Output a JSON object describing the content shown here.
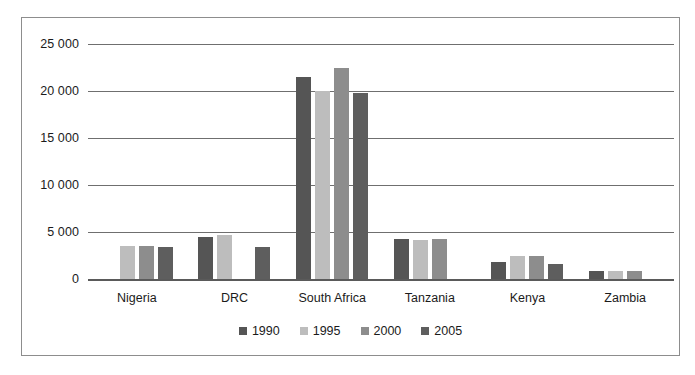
{
  "chart_data": {
    "type": "bar",
    "title": "",
    "subtitle": "",
    "xlabel": "",
    "ylabel": "",
    "categories": [
      "Nigeria",
      "DRC",
      "South Africa",
      "Tanzania",
      "Kenya",
      "Zambia"
    ],
    "series": [
      {
        "name": "1990",
        "color": "#555555",
        "values": [
          null,
          4500,
          21500,
          4250,
          1800,
          850
        ]
      },
      {
        "name": "1995",
        "color": "#bdbdbd",
        "values": [
          3500,
          4650,
          20050,
          4200,
          2400,
          900
        ]
      },
      {
        "name": "2000",
        "color": "#8d8d8d",
        "values": [
          3500,
          null,
          22450,
          4300,
          2400,
          880
        ]
      },
      {
        "name": "2005",
        "color": "#5e5e5e",
        "values": [
          3450,
          3450,
          19800,
          null,
          1600,
          null
        ]
      }
    ],
    "ylim": [
      0,
      25000
    ],
    "yticks": [
      0,
      5000,
      10000,
      15000,
      20000,
      25000
    ],
    "ytick_labels": [
      "0",
      "5 000",
      "10 000",
      "15 000",
      "20 000",
      "25 000"
    ],
    "grid": true,
    "legend_position": "bottom",
    "legend": [
      "1990",
      "1995",
      "2000",
      "2005"
    ],
    "frame": true,
    "frame_color": "#8d8d8d",
    "gridline_color": "#6f6f6f",
    "text_color": "#1b1b1b"
  }
}
